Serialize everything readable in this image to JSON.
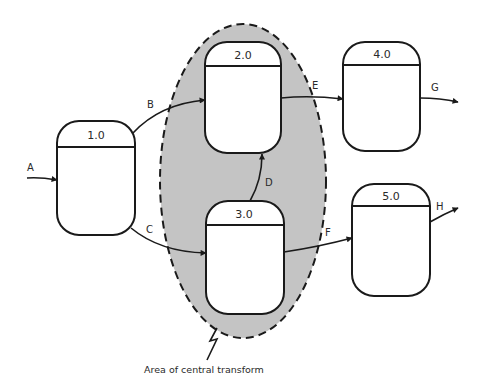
{
  "diagram": {
    "type": "data-flow-diagram",
    "central_transform": {
      "label": "Area of central transform",
      "fill": "#c4c4c4",
      "contains": [
        "2.0",
        "3.0"
      ]
    },
    "processes": [
      {
        "id": "1.0",
        "label": "1.0"
      },
      {
        "id": "2.0",
        "label": "2.0"
      },
      {
        "id": "3.0",
        "label": "3.0"
      },
      {
        "id": "4.0",
        "label": "4.0"
      },
      {
        "id": "5.0",
        "label": "5.0"
      }
    ],
    "flows": [
      {
        "label": "A",
        "from": null,
        "to": "1.0"
      },
      {
        "label": "B",
        "from": "1.0",
        "to": "2.0"
      },
      {
        "label": "C",
        "from": "1.0",
        "to": "3.0"
      },
      {
        "label": "D",
        "from": "3.0",
        "to": "2.0"
      },
      {
        "label": "E",
        "from": "2.0",
        "to": "4.0"
      },
      {
        "label": "F",
        "from": "3.0",
        "to": "5.0"
      },
      {
        "label": "G",
        "from": "4.0",
        "to": null
      },
      {
        "label": "H",
        "from": "5.0",
        "to": null
      }
    ]
  }
}
